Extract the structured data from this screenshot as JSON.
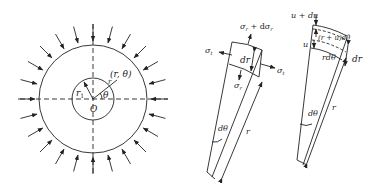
{
  "figure_left": {
    "title": "Thick-walled cylinder under external pressure",
    "labels": {
      "point": "(r, θ)",
      "r": "r",
      "r1": "r",
      "r1_sub": "1",
      "theta": "θ",
      "origin": "O"
    }
  },
  "figure_middle": {
    "title": "Stress element",
    "labels": {
      "sigma_r_plus": "σ",
      "sigma_r_plus_sub": "r",
      "sigma_r_plus_tail": " + dσ",
      "sigma_r_plus_tail_sub": "r",
      "sigma_t_left": "σ",
      "sigma_t_left_sub": "t",
      "sigma_t_right": "σ",
      "sigma_t_right_sub": "t",
      "sigma_r": "σ",
      "sigma_r_sub": "r",
      "dr": "dr",
      "dtheta": "dθ",
      "r": "r"
    }
  },
  "figure_right": {
    "title": "Displacement element",
    "labels": {
      "u_plus_du": "u + du",
      "u": "u",
      "r_plus_u_dtheta": "(r + u)dθ",
      "r_dtheta": "rdθ",
      "dr": "dr",
      "dtheta": "dθ",
      "r": "r"
    }
  }
}
